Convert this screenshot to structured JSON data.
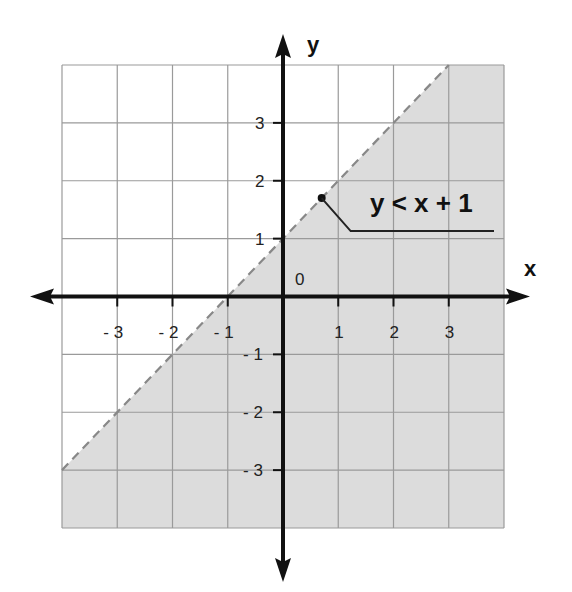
{
  "chart_data": {
    "type": "area",
    "title": "",
    "xlabel": "x",
    "ylabel": "y",
    "xlim": [
      -4,
      4
    ],
    "ylim": [
      -4,
      4
    ],
    "grid": true,
    "origin_label": "0",
    "x_ticks": [
      -3,
      -2,
      -1,
      1,
      2,
      3
    ],
    "x_tick_labels": [
      "- 3",
      "- 2",
      "- 1",
      "1",
      "2",
      "3"
    ],
    "y_ticks": [
      3,
      2,
      1,
      -1,
      -2,
      -3
    ],
    "y_tick_labels": [
      "3",
      "2",
      "1",
      "- 1",
      "- 2",
      "- 3"
    ],
    "series": [
      {
        "name": "boundary y = x + 1",
        "style": "dashed",
        "x": [
          -4,
          3
        ],
        "y": [
          -3,
          4
        ]
      }
    ],
    "shaded_region": {
      "inequality": "y < x + 1",
      "side": "below",
      "vertices": [
        [
          -4,
          -4
        ],
        [
          -4,
          -3
        ],
        [
          3,
          4
        ],
        [
          4,
          4
        ],
        [
          4,
          -4
        ]
      ]
    },
    "annotations": [
      {
        "text": "y < x + 1",
        "pointer_at": [
          0.7,
          1.7
        ]
      }
    ],
    "colors": {
      "shade": "#dcdcdc",
      "grid": "#9a9a9a",
      "axis": "#111111",
      "boundary": "#888888"
    }
  }
}
